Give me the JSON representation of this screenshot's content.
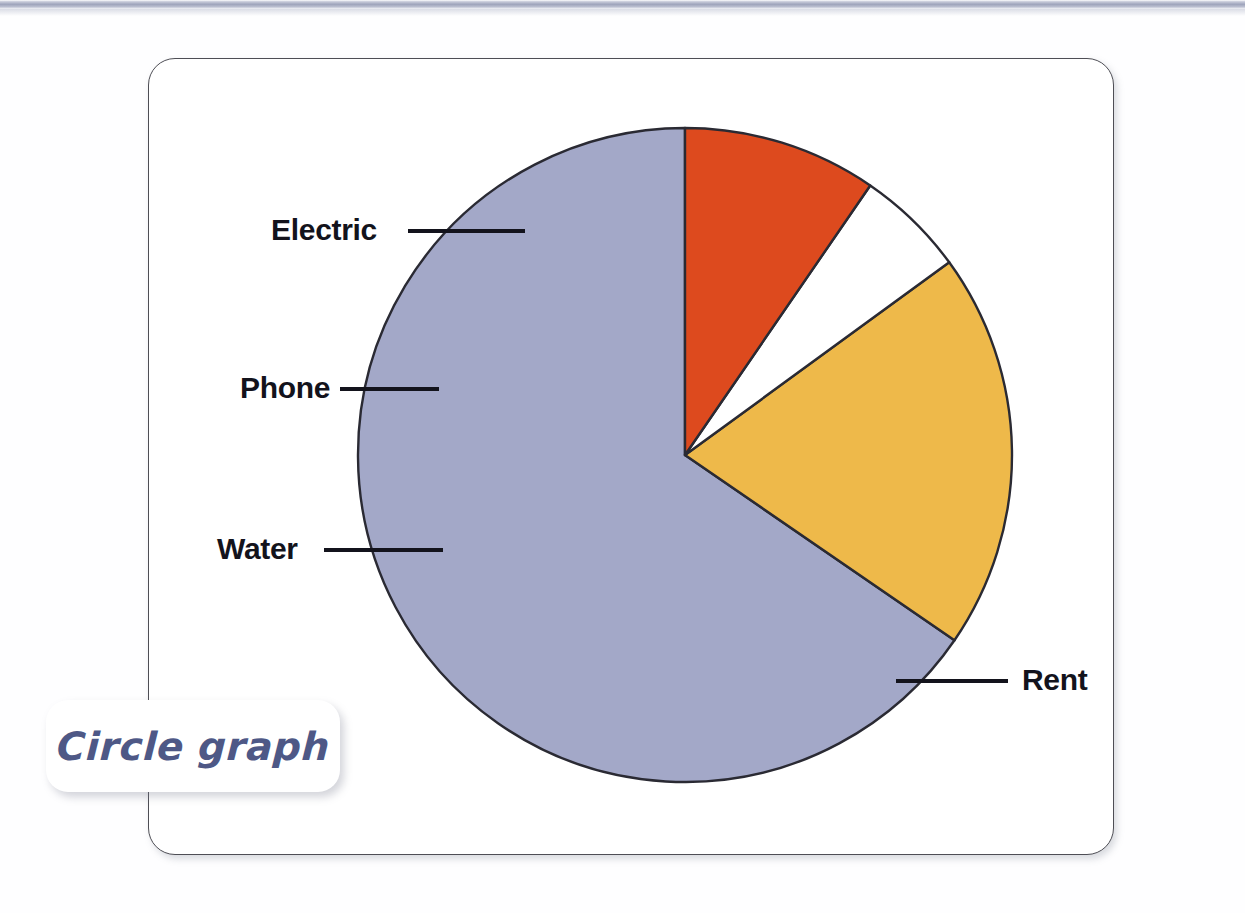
{
  "page": {
    "background_color": "#fefeff",
    "top_bar_color": "#9ea4bb"
  },
  "callout": {
    "label": "Circle graph",
    "text_color": "#4e5886",
    "background_color": "#ffffff"
  },
  "figure": {
    "border_color": "#4e4e55",
    "background_color": "#ffffff"
  },
  "labels": {
    "electric": "Electric",
    "phone": "Phone",
    "water": "Water",
    "rent": "Rent"
  },
  "chart_data": {
    "type": "pie",
    "title": "Circle graph",
    "xlabel": "",
    "ylabel": "",
    "grid": false,
    "legend_position": "none",
    "labels_placement": "external callout lines",
    "center": [
      685,
      455
    ],
    "radius": 327,
    "start_angle_deg": -90,
    "direction": "counterclockwise",
    "stroke_color": "#2a2a33",
    "categories": [
      "Rent",
      "Electric",
      "Phone",
      "Water"
    ],
    "values": [
      65.4,
      19.6,
      5.4,
      9.6
    ],
    "slices": [
      {
        "name": "Rent",
        "percent": 65.4,
        "sweep_deg": 235.5,
        "color": "#a3a8c8",
        "label": "Rent",
        "label_side": "right"
      },
      {
        "name": "Electric",
        "percent": 19.6,
        "sweep_deg": 70.6,
        "color": "#eeb94a",
        "label": "Electric",
        "label_side": "left"
      },
      {
        "name": "Phone",
        "percent": 5.4,
        "sweep_deg": 19.4,
        "color": "#ffffff",
        "label": "Phone",
        "label_side": "left"
      },
      {
        "name": "Water",
        "percent": 9.6,
        "sweep_deg": 34.5,
        "color": "#dd4a1e",
        "label": "Water",
        "label_side": "left"
      }
    ]
  }
}
